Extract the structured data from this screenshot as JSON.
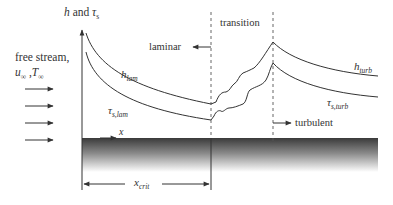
{
  "diagram": {
    "y_axis": {
      "label_main": "h",
      "label_and": "and",
      "label_tau": "τ",
      "label_tau_sub": "s"
    },
    "x_axis": {
      "label": "x"
    },
    "free_stream": {
      "line1": "free stream,",
      "u": "u",
      "u_sub": "∞",
      "sep": ",",
      "T": "T",
      "T_sub": "∞",
      "arrow_count": 4
    },
    "regions": {
      "laminar": "laminar",
      "transition": "transition",
      "turbulent": "turbulent"
    },
    "curves": {
      "h_lam": {
        "main": "h",
        "sub": "lam"
      },
      "tau_lam": {
        "main": "τ",
        "sub": "s,lam"
      },
      "h_turb": {
        "main": "h",
        "sub": "turb"
      },
      "tau_turb": {
        "main": "τ",
        "sub": "s,turb"
      }
    },
    "x_crit": {
      "main": "x",
      "sub": "crit"
    },
    "colors": {
      "line": "#333333",
      "plate_top": "#3a3a3a",
      "plate_bottom": "#ffffff"
    }
  }
}
